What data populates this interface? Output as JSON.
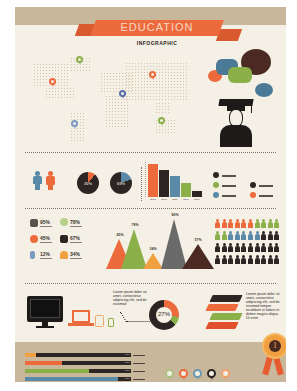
{
  "header": {
    "title": "EDUCATION",
    "subtitle": "INFOGRAPHIC"
  },
  "colors": {
    "orange": "#ec6a3c",
    "green": "#8bb04a",
    "blue": "#5a8aa8",
    "dark": "#2d2523",
    "tan": "#c8b79b",
    "cream": "#f4f0e6",
    "light_orange": "#f0a86a"
  },
  "map": {
    "pins": [
      {
        "name": "north-america-north",
        "color": "#8bb04a"
      },
      {
        "name": "north-america-west",
        "color": "#ec6a3c"
      },
      {
        "name": "south-america",
        "color": "#7f9ac0"
      },
      {
        "name": "europe",
        "color": "#5a6ea8"
      },
      {
        "name": "asia",
        "color": "#ec6a3c"
      },
      {
        "name": "australia",
        "color": "#8bb04a"
      }
    ]
  },
  "gender_stats": {
    "male_percent": "30%",
    "female_percent": "69%"
  },
  "chart_data": [
    {
      "type": "bar",
      "title": "",
      "categories": [
        "2012",
        "2013",
        "2011",
        "2010",
        "2009"
      ],
      "values": [
        95,
        78,
        62,
        40,
        18
      ],
      "colors": [
        "#ec6a3c",
        "#2d2523",
        "#5a8aa8",
        "#8bb04a",
        "#2d2523"
      ],
      "legend": [
        {
          "color": "#2d2523",
          "label": "lorem ipsum"
        },
        {
          "color": "#8bb04a",
          "label": "lorem ipsum"
        },
        {
          "color": "#5a8aa8",
          "label": "lorem ipsum"
        },
        {
          "color": "#2d2523",
          "label": "lorem ipsum"
        },
        {
          "color": "#ec6a3c",
          "label": "lorem ipsum"
        }
      ]
    },
    {
      "type": "area",
      "title": "",
      "categories": [
        "A",
        "B",
        "C",
        "D",
        "E"
      ],
      "values": [
        45,
        78,
        34,
        90,
        57
      ],
      "labels": [
        "45%",
        "78%",
        "34%",
        "90%",
        "57%"
      ],
      "colors": [
        "#ec6a3c",
        "#8bb04a",
        "#f0a040",
        "#6a6a6a",
        "#4a2a22"
      ]
    },
    {
      "type": "pie",
      "title": "",
      "values": [
        27,
        9,
        64
      ],
      "labels": [
        "27%"
      ],
      "colors": [
        "#ec6a3c",
        "#8bb04a",
        "#2d2523"
      ]
    },
    {
      "type": "bar",
      "title": "",
      "orientation": "horizontal",
      "values": [
        10,
        35,
        60,
        88
      ],
      "labels": [
        "10%",
        "35%",
        "60%",
        "88%"
      ],
      "colors": [
        "#f0a040",
        "#ec6a3c",
        "#8bb04a",
        "#5a8aa8"
      ]
    }
  ],
  "stats": [
    {
      "icon": "book-icon",
      "value": "95%",
      "color": "#5a524c"
    },
    {
      "icon": "lightbulb-icon",
      "value": "78%",
      "color": "#b8d08a"
    },
    {
      "icon": "globe-icon",
      "value": "45%",
      "color": "#ec6a3c"
    },
    {
      "icon": "graduation-icon",
      "value": "67%",
      "color": "#2d2523"
    },
    {
      "icon": "microscope-icon",
      "value": "12%",
      "color": "#7f9ac0"
    },
    {
      "icon": "flask-icon",
      "value": "34%",
      "color": "#f0a040"
    }
  ],
  "people_grid": {
    "rows": [
      [
        "#ec6a3c",
        "#ec6a3c",
        "#ec6a3c",
        "#ec6a3c",
        "#ec6a3c",
        "#ec6a3c",
        "#8bb04a",
        "#8bb04a",
        "#8bb04a",
        "#8bb04a"
      ],
      [
        "#8bb04a",
        "#8bb04a",
        "#5a8aa8",
        "#5a8aa8",
        "#5a8aa8",
        "#5a8aa8",
        "#5a8aa8",
        "#2d2523",
        "#2d2523",
        "#2d2523"
      ],
      [
        "#2d2523",
        "#2d2523",
        "#2d2523",
        "#2d2523",
        "#2d2523",
        "#2d2523",
        "#2d2523",
        "#2d2523",
        "#2d2523",
        "#2d2523"
      ],
      [
        "#2d2523",
        "#2d2523",
        "#2d2523",
        "#2d2523",
        "#2d2523",
        "#2d2523",
        "#2d2523",
        "#2d2523",
        "#2d2523",
        "#2d2523"
      ]
    ]
  },
  "devices_section": {
    "callout_text": "Lorem ipsum dolor sit amet, consectetur adipiscing elit, sed do eiusmod",
    "donut_label": "27%"
  },
  "books_section": {
    "text": "Lorem ipsum dolor sit amet, consectetur adipiscing elit, sed do eiusmod tempor incididunt ut labore et dolore magna aliqua. Ut enim"
  },
  "progress_bars": [
    {
      "pct": "10%",
      "fill": 10,
      "color": "#f0a040"
    },
    {
      "pct": "35%",
      "fill": 35,
      "color": "#ec6a3c"
    },
    {
      "pct": "60%",
      "fill": 60,
      "color": "#8bb04a"
    },
    {
      "pct": "88%",
      "fill": 88,
      "color": "#5a8aa8"
    }
  ],
  "bottom_pins": [
    {
      "color": "#a8c080"
    },
    {
      "color": "#ec6a3c"
    },
    {
      "color": "#6a98b0"
    },
    {
      "color": "#2d2523"
    },
    {
      "color": "#f0a06a"
    }
  ],
  "medal": {
    "label": "1"
  }
}
